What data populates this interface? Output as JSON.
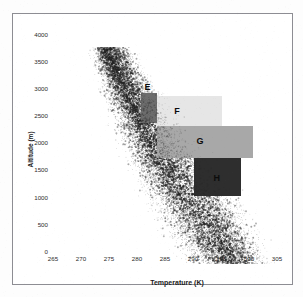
{
  "chart_data": {
    "type": "scatter",
    "title": "",
    "xlabel": "Temperature (K)",
    "ylabel": "Altitude (m)",
    "xlim": [
      265,
      305
    ],
    "ylim": [
      0,
      4000
    ],
    "xticks": [
      265,
      270,
      275,
      280,
      285,
      290,
      295,
      300,
      305
    ],
    "yticks": [
      0,
      500,
      1000,
      1500,
      2000,
      2500,
      3000,
      3500,
      4000
    ],
    "grid": false,
    "legend": "none",
    "point_color": "#333333",
    "series": [
      {
        "name": "soundings",
        "marker": "point",
        "n_points_approx": 14000,
        "envelope": [
          {
            "altitude": 4000,
            "t_min": 269.5,
            "t_mode": 272.5,
            "t_max": 277.0
          },
          {
            "altitude": 3500,
            "t_min": 270.5,
            "t_mode": 274.5,
            "t_max": 280.0
          },
          {
            "altitude": 3000,
            "t_min": 272.0,
            "t_mode": 277.0,
            "t_max": 283.5
          },
          {
            "altitude": 2500,
            "t_min": 273.5,
            "t_mode": 279.5,
            "t_max": 287.5
          },
          {
            "altitude": 2000,
            "t_min": 275.5,
            "t_mode": 282.0,
            "t_max": 291.0
          },
          {
            "altitude": 1500,
            "t_min": 277.5,
            "t_mode": 285.0,
            "t_max": 294.5
          },
          {
            "altitude": 1000,
            "t_min": 280.0,
            "t_mode": 288.5,
            "t_max": 298.0
          },
          {
            "altitude": 500,
            "t_min": 283.0,
            "t_mode": 292.0,
            "t_max": 300.5
          },
          {
            "altitude": 0,
            "t_min": 286.0,
            "t_mode": 295.0,
            "t_max": 302.5
          }
        ]
      }
    ],
    "annotations": [
      {
        "label": "E",
        "shade": "dark",
        "fill": "#6d6d6d",
        "t_range": [
          278.5,
          281.5
        ],
        "altitude_range": [
          2600,
          3150
        ],
        "label_t": 279.2,
        "label_altitude": 3250
      },
      {
        "label": "F",
        "shade": "light",
        "fill": "#e6e6e6",
        "t_range": [
          281.5,
          293.0
        ],
        "altitude_range": [
          2550,
          3100
        ],
        "label_t": 284.5,
        "label_altitude": 2800
      },
      {
        "label": "G",
        "shade": "medium",
        "fill": "#a8a8a8",
        "t_range": [
          281.5,
          298.5
        ],
        "altitude_range": [
          1950,
          2550
        ],
        "label_t": 288.5,
        "label_altitude": 2250
      },
      {
        "label": "H",
        "shade": "very-dark",
        "fill": "#2e2e2e",
        "t_range": [
          288.0,
          296.5
        ],
        "altitude_range": [
          1250,
          1950
        ],
        "label_t": 291.5,
        "label_altitude": 1560
      }
    ]
  },
  "axes": {
    "x_title": "Temperature (K)",
    "y_title": "Altitude (m)",
    "x_tick_labels": [
      "265",
      "270",
      "275",
      "280",
      "285",
      "290",
      "295",
      "300",
      "305"
    ],
    "y_tick_labels": [
      "0",
      "500",
      "1000",
      "1500",
      "2000",
      "2500",
      "3000",
      "3500",
      "4000"
    ]
  },
  "region_labels": {
    "e": "E",
    "f": "F",
    "g": "G",
    "h": "H"
  }
}
